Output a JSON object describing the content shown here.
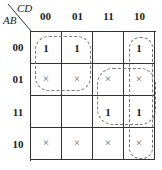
{
  "kmap": {
    "corner": {
      "col_var": "CD",
      "row_var": "AB"
    },
    "columns": [
      "00",
      "01",
      "11",
      "10"
    ],
    "rows": [
      {
        "label": "00",
        "cells": [
          "1",
          "1",
          "",
          "1"
        ]
      },
      {
        "label": "01",
        "cells": [
          "×",
          "×",
          "×",
          "×"
        ]
      },
      {
        "label": "11",
        "cells": [
          "",
          "",
          "1",
          "1"
        ]
      },
      {
        "label": "10",
        "cells": [
          "×",
          "×",
          "×",
          "×"
        ]
      }
    ],
    "groupings": [
      {
        "name": "group-ab00-01-cd00-01",
        "rows": [
          "00",
          "01"
        ],
        "cols": [
          "00",
          "01"
        ]
      },
      {
        "name": "group-cd10-column",
        "rows": [
          "00",
          "01",
          "11",
          "10"
        ],
        "cols": [
          "10"
        ]
      },
      {
        "name": "group-ab01-11-cd11-10",
        "rows": [
          "01",
          "11"
        ],
        "cols": [
          "11",
          "10"
        ]
      }
    ],
    "colors": {
      "grid": "#333333",
      "loop": "#777777",
      "dont_care": "#777777"
    }
  }
}
